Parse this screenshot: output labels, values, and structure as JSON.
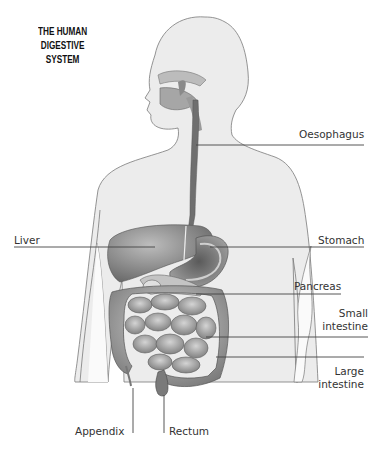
{
  "diagram": {
    "title_lines": [
      "THE HUMAN",
      "DIGESTIVE",
      "SYSTEM"
    ],
    "labels": {
      "oesophagus": "Oesophagus",
      "liver": "Liver",
      "stomach": "Stomach",
      "pancreas": "Pancreas",
      "small_intestine_1": "Small",
      "small_intestine_2": "intestine",
      "large_intestine_1": "Large",
      "large_intestine_2": "intestine",
      "appendix": "Appendix",
      "rectum": "Rectum"
    },
    "colors": {
      "body_fill": "#ececec",
      "outline": "#7a7a7a",
      "organ_dark": "#6e6e6e",
      "organ_mid": "#a8a8a8",
      "organ_light": "#cfcfcf",
      "leader_line": "#444444",
      "text": "#333333"
    }
  }
}
